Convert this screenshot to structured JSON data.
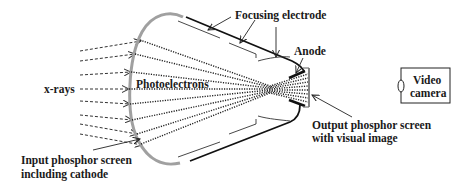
{
  "labels": {
    "focusing_electrode": "Focusing electrode",
    "anode": "Anode",
    "photoelectrons": "Photoelectrons",
    "xrays": "x-rays",
    "input_screen_line1": "Input phosphor screen",
    "input_screen_line2": "including cathode",
    "output_screen_line1": "Output phosphor screen",
    "output_screen_line2": "with visual image",
    "camera_line1": "Video",
    "camera_line2": "camera"
  },
  "colors": {
    "input_screen": "#a0a0a0",
    "envelope": "#111111",
    "electron_paths": "#222222",
    "xray_arrows": "#333333"
  },
  "xray_arrow_count": 9,
  "electron_path_count": 9
}
